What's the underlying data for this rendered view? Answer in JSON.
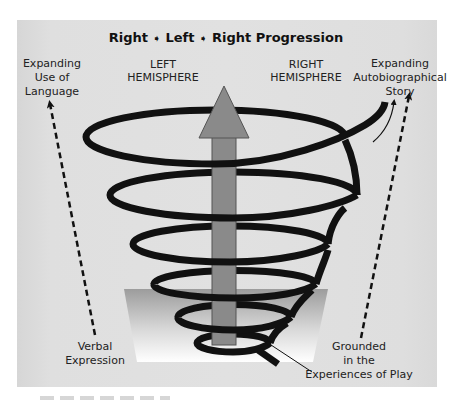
{
  "diagram": {
    "title": {
      "part1": "Right",
      "arrow_glyph": "➧",
      "part2": "Left",
      "part3": "Right Progression"
    },
    "hemispheres": {
      "left": {
        "line1": "LEFT",
        "line2": "HEMISPHERE"
      },
      "right": {
        "line1": "RIGHT",
        "line2": "HEMISPHERE"
      }
    },
    "top_left_label": {
      "line1": "Expanding",
      "line2": "Use of",
      "line3": "Language"
    },
    "top_right_label": {
      "line1": "Expanding",
      "line2": "Autobiographical",
      "line3": "Story"
    },
    "bottom_left_label": {
      "line1": "Verbal",
      "line2": "Expression"
    },
    "bottom_right_label": {
      "line1": "Grounded",
      "line2": "in the",
      "line3": "Experiences of Play"
    },
    "central_arrow": {
      "icon": "up-arrow-icon",
      "direction": "up"
    },
    "spiral": {
      "loops": 6,
      "direction": "expanding-upward"
    },
    "colors": {
      "panel_background": "#e0e0e0",
      "arrow_fill": "#8a8a8a",
      "arrow_stroke": "#555555",
      "spiral": "#111111",
      "base_top": "#9a9a9a",
      "base_bottom": "#ffffff",
      "text": "#222222"
    }
  }
}
